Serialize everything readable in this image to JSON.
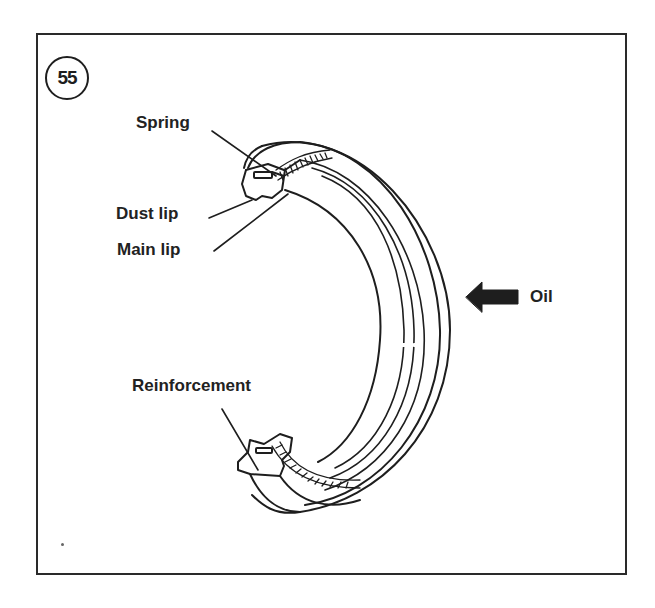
{
  "figure": {
    "number": "55"
  },
  "labels": {
    "spring": "Spring",
    "dust_lip": "Dust lip",
    "main_lip": "Main lip",
    "reinforcement": "Reinforcement",
    "oil": "Oil"
  },
  "colors": {
    "line": "#1e1e1e",
    "background": "#ffffff"
  }
}
